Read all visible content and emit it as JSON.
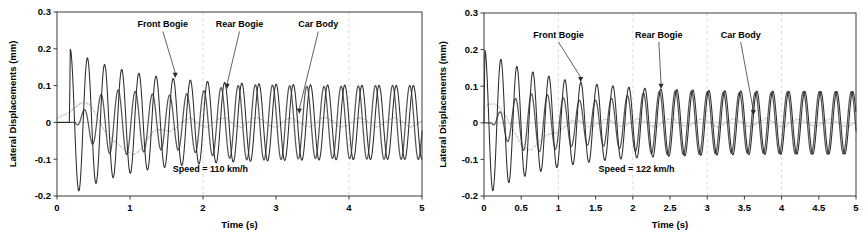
{
  "figure": {
    "title": "",
    "panel_count": 2
  },
  "chart_data": [
    {
      "type": "line",
      "panel": "left",
      "title": "",
      "subtitle": "",
      "xlabel": "Time (s)",
      "ylabel": "Lateral Displacements (mm)",
      "xlim": [
        0,
        5
      ],
      "ylim": [
        -0.2,
        0.3
      ],
      "xticks": [
        "0",
        "1",
        "2",
        "3",
        "4",
        "5"
      ],
      "xtick_values": [
        0,
        1,
        2,
        3,
        4,
        5
      ],
      "yticks": [
        "0.3",
        "0.2",
        "0.1",
        "0",
        "-0.1",
        "-0.2"
      ],
      "ytick_values": [
        0.3,
        0.2,
        0.1,
        0,
        -0.1,
        -0.2
      ],
      "grid": true,
      "grid_style": "dashed-light-vertical",
      "legend_position": "inline-annotations",
      "annotations": [
        {
          "name": "speed",
          "text": "Speed = 110 km/h",
          "x": 2.1,
          "y": -0.135
        },
        {
          "name": "front-bogie-callout",
          "text": "Front Bogie",
          "label_x": 1.45,
          "label_y": 0.258,
          "point_x": 1.62,
          "point_y": 0.118
        },
        {
          "name": "rear-bogie-callout",
          "text": "Rear Bogie",
          "label_x": 2.5,
          "label_y": 0.258,
          "point_x": 2.33,
          "point_y": 0.088
        },
        {
          "name": "car-body-callout",
          "text": "Car Body",
          "label_x": 3.58,
          "label_y": 0.258,
          "point_x": 3.32,
          "point_y": 0.021
        }
      ],
      "series": [
        {
          "name": "Front Bogie",
          "color": "#2b2b2b",
          "style": "solid",
          "description": "Hunting oscillation, onset at t=0.17 s, peak 0.20 mm, settles to limit cycle +/-0.10 mm, period approx 0.235 s",
          "onset": 0.17,
          "initial_peak": 0.2,
          "min_peak": -0.18,
          "steady_amplitude": 0.1,
          "period": 0.235
        },
        {
          "name": "Rear Bogie",
          "color": "#555555",
          "style": "solid",
          "description": "Hunting oscillation lagging front bogie by about half a period, steady amplitude +/-0.10 mm",
          "onset": 0.25,
          "steady_amplitude": 0.1,
          "period": 0.235,
          "phase_lag": 0.5
        },
        {
          "name": "Car Body",
          "color": "#b0b0b0",
          "style": "dotted",
          "description": "Small transient excursion to about -0.09 mm near t=0.9 s then near zero with ripple under 0.015 mm",
          "transient_min": -0.09,
          "steady_amplitude": 0.012
        }
      ]
    },
    {
      "type": "line",
      "panel": "right",
      "title": "",
      "subtitle": "",
      "xlabel": "Time (s)",
      "ylabel": "Lateral Displacements (mm)",
      "xlim": [
        0,
        5
      ],
      "ylim": [
        -0.2,
        0.3
      ],
      "xticks": [
        "0",
        "0.5",
        "1",
        "1.5",
        "2",
        "2.5",
        "3",
        "3.5",
        "4",
        "4.5",
        "5"
      ],
      "xtick_values": [
        0,
        0.5,
        1,
        1.5,
        2,
        2.5,
        3,
        3.5,
        4,
        4.5,
        5
      ],
      "yticks": [
        "0.3",
        "0.2",
        "0.1",
        "0",
        "-0.1",
        "-0.2"
      ],
      "ytick_values": [
        0.3,
        0.2,
        0.1,
        0,
        -0.1,
        -0.2
      ],
      "grid": true,
      "grid_style": "dashed-light-vertical",
      "legend_position": "inline-annotations",
      "annotations": [
        {
          "name": "speed",
          "text": "Speed = 122 km/h",
          "x": 2.05,
          "y": -0.135
        },
        {
          "name": "front-bogie-callout",
          "text": "Front Bogie",
          "label_x": 1.0,
          "label_y": 0.232,
          "point_x": 1.3,
          "point_y": 0.108
        },
        {
          "name": "rear-bogie-callout",
          "text": "Rear Bogie",
          "label_x": 2.35,
          "label_y": 0.232,
          "point_x": 2.38,
          "point_y": 0.09
        },
        {
          "name": "car-body-callout",
          "text": "Car Body",
          "label_x": 3.45,
          "label_y": 0.232,
          "point_x": 3.62,
          "point_y": 0.018
        }
      ],
      "series": [
        {
          "name": "Front Bogie",
          "color": "#2b2b2b",
          "style": "solid",
          "description": "Hunting oscillation starting at t=0 from 0.20 mm, dips to -0.175 mm, settles to limit cycle +/-0.085 mm, period approx 0.215 s",
          "onset": 0.0,
          "initial_peak": 0.2,
          "min_peak": -0.175,
          "steady_amplitude": 0.085,
          "period": 0.215
        },
        {
          "name": "Rear Bogie",
          "color": "#555555",
          "style": "solid",
          "description": "Hunting oscillation lagging front bogie by about half a period, steady amplitude +/-0.085 mm",
          "onset": 0.1,
          "steady_amplitude": 0.085,
          "period": 0.215,
          "phase_lag": 0.5
        },
        {
          "name": "Car Body",
          "color": "#b0b0b0",
          "style": "dotted",
          "description": "Transient excursion to about -0.07 mm near t=0.6 s then near zero with ripple under 0.012 mm",
          "transient_min": -0.07,
          "steady_amplitude": 0.01
        }
      ]
    }
  ]
}
